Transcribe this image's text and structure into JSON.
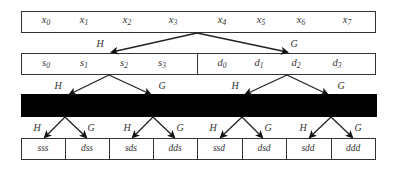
{
  "diagram": {
    "type": "wavelet-packet-decomposition-tree",
    "level0": {
      "cells": [
        {
          "base": "x",
          "sub": "0"
        },
        {
          "base": "x",
          "sub": "1"
        },
        {
          "base": "x",
          "sub": "2"
        },
        {
          "base": "x",
          "sub": "3"
        },
        {
          "base": "x",
          "sub": "4"
        },
        {
          "base": "x",
          "sub": "5"
        },
        {
          "base": "x",
          "sub": "6"
        },
        {
          "base": "x",
          "sub": "7"
        }
      ]
    },
    "level1": {
      "left_filter": "H",
      "right_filter": "G",
      "cells": [
        {
          "base": "s",
          "sub": "0"
        },
        {
          "base": "s",
          "sub": "1"
        },
        {
          "base": "s",
          "sub": "2"
        },
        {
          "base": "s",
          "sub": "3"
        },
        {
          "base": "d",
          "sub": "0"
        },
        {
          "base": "d",
          "sub": "1"
        },
        {
          "base": "d",
          "sub": "2"
        },
        {
          "base": "d",
          "sub": "3"
        }
      ]
    },
    "level2": {
      "redacted": true,
      "filters": [
        "H",
        "G",
        "H",
        "G"
      ]
    },
    "level3": {
      "filters": [
        "H",
        "G",
        "H",
        "G",
        "H",
        "G",
        "H",
        "G"
      ],
      "cells": [
        "sss",
        "dss",
        "sds",
        "dds",
        "ssd",
        "dsd",
        "sdd",
        "ddd"
      ]
    },
    "colors": {
      "stroke": "#333333",
      "redaction": "#000000",
      "background": "#ffffff"
    }
  }
}
